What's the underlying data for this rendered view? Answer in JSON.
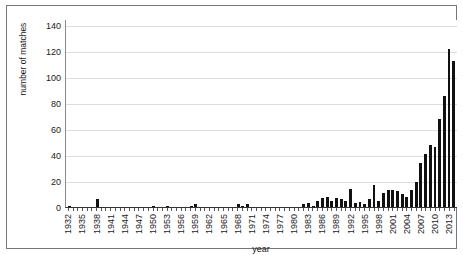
{
  "chart_data": {
    "type": "bar",
    "title": "",
    "xlabel": "year",
    "ylabel": "number of matches",
    "ylim": [
      0,
      145
    ],
    "yticks": [
      0,
      20,
      40,
      60,
      80,
      100,
      120,
      140
    ],
    "grid": "horizontal",
    "legend": "none",
    "bar_color": "#111111",
    "xtick_step": 3,
    "xtick_labels": [
      "1932",
      "1935",
      "1938",
      "1941",
      "1944",
      "1947",
      "1950",
      "1953",
      "1956",
      "1959",
      "1962",
      "1965",
      "1968",
      "1971",
      "1974",
      "1977",
      "1980",
      "1983",
      "1986",
      "1989",
      "1992",
      "1995",
      "1998",
      "2001",
      "2004",
      "2007",
      "2010",
      "2013"
    ],
    "categories": [
      "1932",
      "1933",
      "1934",
      "1935",
      "1936",
      "1937",
      "1938",
      "1939",
      "1940",
      "1941",
      "1942",
      "1943",
      "1944",
      "1945",
      "1946",
      "1947",
      "1948",
      "1949",
      "1950",
      "1951",
      "1952",
      "1953",
      "1954",
      "1955",
      "1956",
      "1957",
      "1958",
      "1959",
      "1960",
      "1961",
      "1962",
      "1963",
      "1964",
      "1965",
      "1966",
      "1967",
      "1968",
      "1969",
      "1970",
      "1971",
      "1972",
      "1973",
      "1974",
      "1975",
      "1976",
      "1977",
      "1978",
      "1979",
      "1980",
      "1981",
      "1982",
      "1983",
      "1984",
      "1985",
      "1986",
      "1987",
      "1988",
      "1989",
      "1990",
      "1991",
      "1992",
      "1993",
      "1994",
      "1995",
      "1996",
      "1997",
      "1998",
      "1999",
      "2000",
      "2001",
      "2002",
      "2003",
      "2004",
      "2005",
      "2006",
      "2007",
      "2008",
      "2009",
      "2010",
      "2011",
      "2012",
      "2013",
      "2014"
    ],
    "values": [
      1,
      0,
      0,
      0,
      0,
      0,
      6,
      0,
      0,
      0,
      0,
      0,
      0,
      0,
      0,
      0,
      0,
      0,
      1,
      0,
      0,
      1,
      0,
      0,
      0,
      0,
      1,
      2,
      0,
      0,
      0,
      0,
      0,
      0,
      0,
      0,
      2,
      1,
      2,
      0,
      0,
      0,
      0,
      0,
      0,
      0,
      0,
      0,
      0,
      0,
      2,
      3,
      1,
      5,
      7,
      8,
      5,
      7,
      6,
      5,
      14,
      3,
      4,
      2,
      6,
      17,
      5,
      11,
      13,
      13,
      12,
      10,
      8,
      13,
      19,
      34,
      41,
      48,
      46,
      68,
      86,
      122,
      113
    ]
  }
}
